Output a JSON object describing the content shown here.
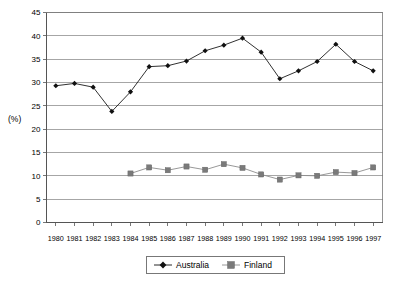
{
  "chart_data": {
    "type": "line",
    "title": "",
    "xlabel": "",
    "ylabel": "(%)",
    "ylim": [
      0,
      45
    ],
    "ytick_step": 5,
    "grid": true,
    "legend_position": "bottom",
    "categories": [
      "1980",
      "1981",
      "1982",
      "1983",
      "1984",
      "1985",
      "1986",
      "1987",
      "1988",
      "1989",
      "1990",
      "1991",
      "1992",
      "1993",
      "1994",
      "1995",
      "1996",
      "1997"
    ],
    "yticks": [
      "0",
      "5",
      "10",
      "15",
      "20",
      "25",
      "30",
      "35",
      "40",
      "45"
    ],
    "series": [
      {
        "name": "Australia",
        "marker": "diamond",
        "color": "#111111",
        "values": [
          29.3,
          29.8,
          29.0,
          23.8,
          28.0,
          33.4,
          33.6,
          34.6,
          36.8,
          38.0,
          39.5,
          36.5,
          30.8,
          32.5,
          34.5,
          38.2,
          34.5,
          32.5
        ]
      },
      {
        "name": "Finland",
        "marker": "square",
        "color": "#7a7a7a",
        "values": [
          null,
          null,
          null,
          null,
          10.5,
          11.8,
          11.2,
          12.0,
          11.3,
          12.5,
          11.7,
          10.3,
          9.2,
          10.1,
          10.0,
          10.8,
          10.6,
          11.8
        ]
      }
    ]
  },
  "legend": {
    "items": [
      {
        "label": "Australia"
      },
      {
        "label": "Finland"
      }
    ]
  },
  "axis": {
    "y_axis_title": "(%)"
  }
}
